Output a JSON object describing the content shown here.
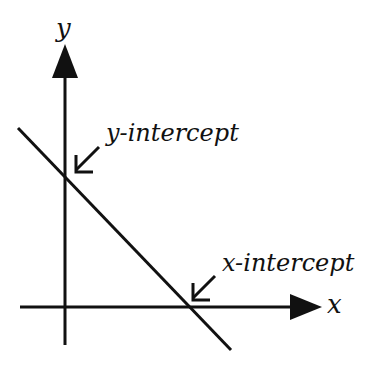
{
  "diagram": {
    "title": "",
    "axes": {
      "x_label": "x",
      "y_label": "y"
    },
    "annotations": {
      "y_intercept": "y-intercept",
      "x_intercept": "x-intercept"
    },
    "colors": {
      "stroke": "#111111",
      "background": "#ffffff"
    }
  }
}
